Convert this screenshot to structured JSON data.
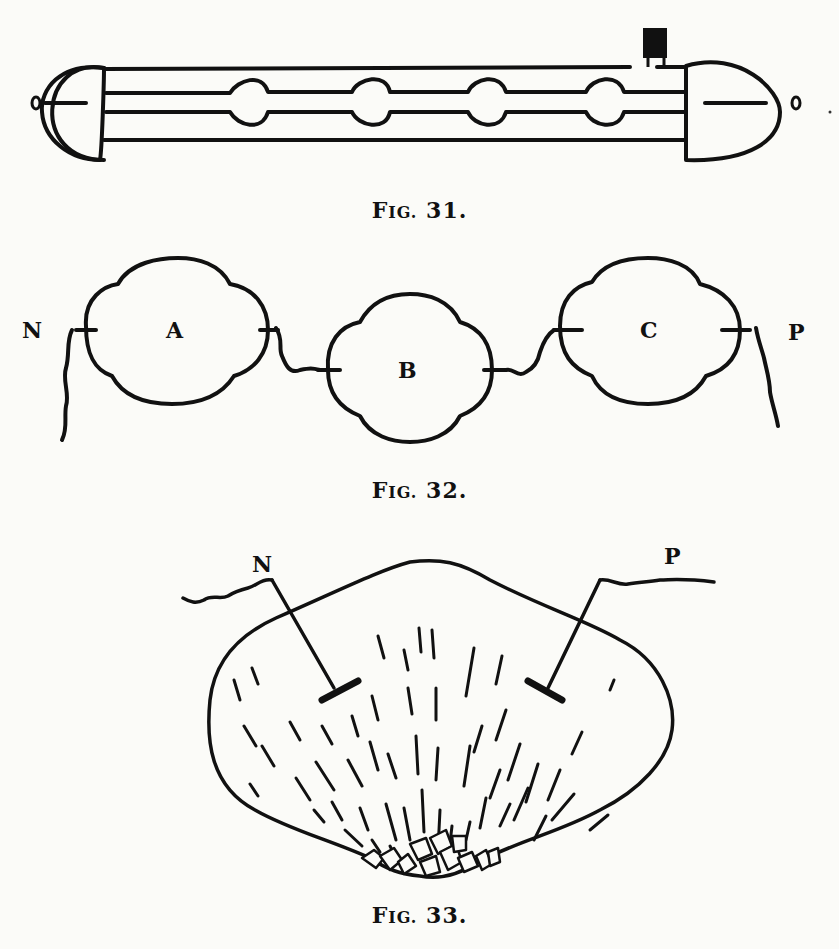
{
  "figures": [
    {
      "id": "fig31",
      "caption_prefix": "F",
      "caption_smallcaps": "IG.",
      "caption_number": "31.",
      "description": "Tube with two bulbous end electrodes and four spherical constrictions, small terminal on top right"
    },
    {
      "id": "fig32",
      "caption_prefix": "F",
      "caption_smallcaps": "IG.",
      "caption_number": "32.",
      "labels": {
        "n": "N",
        "a": "A",
        "b": "B",
        "c": "C",
        "p": "P"
      }
    },
    {
      "id": "fig33",
      "caption_prefix": "F",
      "caption_smallcaps": "IG.",
      "caption_number": "33.",
      "labels": {
        "n": "N",
        "p": "P"
      }
    }
  ],
  "colors": {
    "ink": "#111111",
    "paper": "#fbfbf8",
    "bleed_through": "#e6e6e2"
  }
}
